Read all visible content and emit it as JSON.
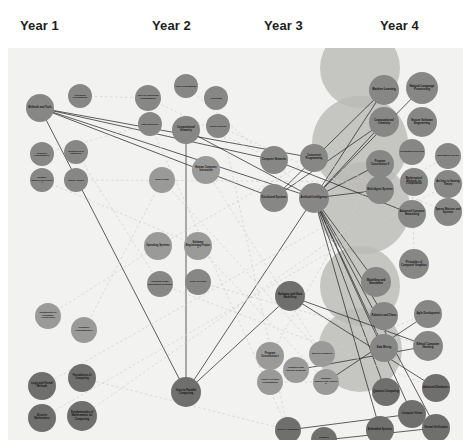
{
  "diagram": {
    "type": "node-link-graph",
    "background_color": "#f2f2f1",
    "node_color": "#8d8d8b",
    "hull_color": "#b9b9b7",
    "edge_color": "#2b2b2b",
    "faint_edge_color": "#cfcfcd",
    "canvas": {
      "width": 455,
      "height": 392
    }
  },
  "columns": [
    {
      "label": "Year 1",
      "x": 20
    },
    {
      "label": "Year 2",
      "x": 152
    },
    {
      "label": "Year 3",
      "x": 264
    },
    {
      "label": "Year 4",
      "x": 380
    }
  ],
  "hulls": [
    {
      "name": "year4-ai-cluster",
      "x": 352,
      "y": 20,
      "r": 40
    },
    {
      "name": "year4-theory-cluster",
      "x": 352,
      "y": 96,
      "r": 48
    },
    {
      "name": "year4-systems-cluster",
      "x": 356,
      "y": 160,
      "r": 46
    },
    {
      "name": "year4-security-cluster",
      "x": 352,
      "y": 238,
      "r": 40
    },
    {
      "name": "year4-capstone-cluster",
      "x": 352,
      "y": 302,
      "r": 42
    }
  ],
  "nodes": [
    {
      "id": "n01",
      "label": "Methods and Tools",
      "year": 1,
      "x": 32,
      "y": 60,
      "r": 14,
      "shade": "mid"
    },
    {
      "id": "n02",
      "label": "Functional Programming",
      "year": 1,
      "x": 72,
      "y": 48,
      "r": 12,
      "shade": "mid"
    },
    {
      "id": "n03",
      "label": "Computer Programming I",
      "year": 1,
      "x": 34,
      "y": 106,
      "r": 12,
      "shade": "mid"
    },
    {
      "id": "n04",
      "label": "Introduction to Databases",
      "year": 1,
      "x": 68,
      "y": 104,
      "r": 12,
      "shade": "mid"
    },
    {
      "id": "n05",
      "label": "Software Engineering Project 1",
      "year": 1,
      "x": 34,
      "y": 132,
      "r": 12,
      "shade": "mid"
    },
    {
      "id": "n06",
      "label": "Matrix Algebra",
      "year": 1,
      "x": 68,
      "y": 132,
      "r": 12,
      "shade": "mid"
    },
    {
      "id": "n07",
      "label": "Introduction to Computer Architecture",
      "year": 1,
      "x": 40,
      "y": 268,
      "r": 13,
      "shade": "light"
    },
    {
      "id": "n08",
      "label": "Computer Programming II",
      "year": 1,
      "x": 76,
      "y": 282,
      "r": 13,
      "shade": "light"
    },
    {
      "id": "n09",
      "label": "Logic and Formal Methods",
      "year": 1,
      "x": 34,
      "y": 338,
      "r": 14,
      "shade": "dark"
    },
    {
      "id": "n10",
      "label": "Foundations of Computing",
      "year": 1,
      "x": 74,
      "y": 330,
      "r": 14,
      "shade": "dark"
    },
    {
      "id": "n11",
      "label": "Discrete Mathematics",
      "year": 1,
      "x": 34,
      "y": 370,
      "r": 14,
      "shade": "dark"
    },
    {
      "id": "n12",
      "label": "Fundamentals of Mathematics for Computing",
      "year": 1,
      "x": 74,
      "y": 368,
      "r": 15,
      "shade": "dark"
    },
    {
      "id": "n13",
      "label": "Intro to Functional Programming",
      "year": 2,
      "x": 140,
      "y": 50,
      "r": 13,
      "shade": "mid"
    },
    {
      "id": "n14",
      "label": "Logic Programming",
      "year": 2,
      "x": 178,
      "y": 38,
      "r": 12,
      "shade": "mid"
    },
    {
      "id": "n15",
      "label": "Algorithms",
      "year": 2,
      "x": 208,
      "y": 50,
      "r": 12,
      "shade": "mid"
    },
    {
      "id": "n16",
      "label": "Data Structures",
      "year": 2,
      "x": 142,
      "y": 76,
      "r": 12,
      "shade": "mid"
    },
    {
      "id": "n17",
      "label": "Computational Geometry",
      "year": 2,
      "x": 178,
      "y": 82,
      "r": 14,
      "shade": "mid"
    },
    {
      "id": "n18",
      "label": "Digital Systems",
      "year": 2,
      "x": 210,
      "y": 78,
      "r": 12,
      "shade": "mid"
    },
    {
      "id": "n19",
      "label": "Web Design",
      "year": 2,
      "x": 154,
      "y": 132,
      "r": 13,
      "shade": "light"
    },
    {
      "id": "n20",
      "label": "Human Computer Interaction",
      "year": 2,
      "x": 198,
      "y": 122,
      "r": 14,
      "shade": "light"
    },
    {
      "id": "n21",
      "label": "Operating Systems",
      "year": 2,
      "x": 150,
      "y": 198,
      "r": 14,
      "shade": "light"
    },
    {
      "id": "n22",
      "label": "Software Engineering Project 1",
      "year": 2,
      "x": 190,
      "y": 198,
      "r": 14,
      "shade": "light"
    },
    {
      "id": "n23",
      "label": "Databases and Information Systems",
      "year": 2,
      "x": 152,
      "y": 236,
      "r": 13,
      "shade": "mid"
    },
    {
      "id": "n24",
      "label": "Cyber Security",
      "year": 2,
      "x": 190,
      "y": 234,
      "r": 13,
      "shade": "mid"
    },
    {
      "id": "n25",
      "label": "Intro to Parallel Computing",
      "year": 2,
      "x": 178,
      "y": 344,
      "r": 15,
      "shade": "dark"
    },
    {
      "id": "n26",
      "label": "Computer Networks",
      "year": 3,
      "x": 266,
      "y": 112,
      "r": 14,
      "shade": "mid"
    },
    {
      "id": "n27",
      "label": "Concurrent Programming",
      "year": 3,
      "x": 306,
      "y": 110,
      "r": 14,
      "shade": "mid"
    },
    {
      "id": "n28",
      "label": "Distributed Systems",
      "year": 3,
      "x": 266,
      "y": 150,
      "r": 14,
      "shade": "mid"
    },
    {
      "id": "n29",
      "label": "Artificial Intelligence",
      "year": 3,
      "x": 306,
      "y": 150,
      "r": 15,
      "shade": "mid"
    },
    {
      "id": "n30",
      "label": "Software and Data Modelling",
      "year": 3,
      "x": 282,
      "y": 248,
      "r": 15,
      "shade": "dark"
    },
    {
      "id": "n31",
      "label": "Program Construction I",
      "year": 3,
      "x": 262,
      "y": 308,
      "r": 14,
      "shade": "light"
    },
    {
      "id": "n32",
      "label": "Web Development",
      "year": 3,
      "x": 314,
      "y": 306,
      "r": 13,
      "shade": "light"
    },
    {
      "id": "n33",
      "label": "Networks and Internet Systems",
      "year": 3,
      "x": 288,
      "y": 322,
      "r": 13,
      "shade": "light"
    },
    {
      "id": "n34",
      "label": "Object Oriented Programming",
      "year": 3,
      "x": 262,
      "y": 334,
      "r": 13,
      "shade": "light"
    },
    {
      "id": "n35",
      "label": "Software Engineering Project 2",
      "year": 3,
      "x": 318,
      "y": 334,
      "r": 13,
      "shade": "light"
    },
    {
      "id": "n36",
      "label": "Intro to Algorithms",
      "year": 3,
      "x": 280,
      "y": 382,
      "r": 13,
      "shade": "dark"
    },
    {
      "id": "n37",
      "label": "Compiler Engineering",
      "year": 3,
      "x": 316,
      "y": 392,
      "r": 13,
      "shade": "dark"
    },
    {
      "id": "n38",
      "label": "Machine Learning",
      "year": 4,
      "x": 376,
      "y": 42,
      "r": 15,
      "shade": "mid"
    },
    {
      "id": "n39",
      "label": "Natural Language Processing",
      "year": 4,
      "x": 414,
      "y": 40,
      "r": 16,
      "shade": "mid"
    },
    {
      "id": "n40",
      "label": "Computational Creativity",
      "year": 4,
      "x": 376,
      "y": 74,
      "r": 15,
      "shade": "mid"
    },
    {
      "id": "n41",
      "label": "Secure Software Engineering",
      "year": 4,
      "x": 414,
      "y": 74,
      "r": 15,
      "shade": "mid"
    },
    {
      "id": "n42",
      "label": "Information Retrieval",
      "year": 4,
      "x": 404,
      "y": 104,
      "r": 13,
      "shade": "mid"
    },
    {
      "id": "n43",
      "label": "Program Construction II",
      "year": 4,
      "x": 372,
      "y": 116,
      "r": 14,
      "shade": "mid"
    },
    {
      "id": "n44",
      "label": "Information Theory",
      "year": 4,
      "x": 440,
      "y": 108,
      "r": 13,
      "shade": "mid"
    },
    {
      "id": "n45",
      "label": "Mathematical Methods for Computation",
      "year": 4,
      "x": 406,
      "y": 134,
      "r": 14,
      "shade": "mid"
    },
    {
      "id": "n46",
      "label": "Multi-Agent Systems",
      "year": 4,
      "x": 372,
      "y": 142,
      "r": 14,
      "shade": "mid"
    },
    {
      "id": "n47",
      "label": "An Intro to Gaming Theory",
      "year": 4,
      "x": 440,
      "y": 136,
      "r": 14,
      "shade": "mid"
    },
    {
      "id": "n48",
      "label": "Advanced Computer Networking",
      "year": 4,
      "x": 404,
      "y": 166,
      "r": 14,
      "shade": "mid"
    },
    {
      "id": "n49",
      "label": "Sparse Matrices and Systems",
      "year": 4,
      "x": 440,
      "y": 164,
      "r": 14,
      "shade": "mid"
    },
    {
      "id": "n50",
      "label": "Principles of Computer Graphics",
      "year": 4,
      "x": 406,
      "y": 216,
      "r": 15,
      "shade": "mid"
    },
    {
      "id": "n51",
      "label": "Modelling and Simulation",
      "year": 4,
      "x": 368,
      "y": 234,
      "r": 15,
      "shade": "mid"
    },
    {
      "id": "n52",
      "label": "Robotics and Chaos",
      "year": 4,
      "x": 376,
      "y": 268,
      "r": 14,
      "shade": "mid"
    },
    {
      "id": "n53",
      "label": "Agile Development",
      "year": 4,
      "x": 420,
      "y": 266,
      "r": 14,
      "shade": "mid"
    },
    {
      "id": "n54",
      "label": "Data Mining",
      "year": 4,
      "x": 376,
      "y": 300,
      "r": 14,
      "shade": "mid"
    },
    {
      "id": "n55",
      "label": "Ethical Computer Hacking",
      "year": 4,
      "x": 420,
      "y": 298,
      "r": 15,
      "shade": "mid"
    },
    {
      "id": "n56",
      "label": "Quantum Computing",
      "year": 4,
      "x": 378,
      "y": 344,
      "r": 14,
      "shade": "dark"
    },
    {
      "id": "n57",
      "label": "Advanced Databases",
      "year": 4,
      "x": 428,
      "y": 340,
      "r": 14,
      "shade": "dark"
    },
    {
      "id": "n58",
      "label": "Computer Vision",
      "year": 4,
      "x": 404,
      "y": 366,
      "r": 14,
      "shade": "dark"
    },
    {
      "id": "n59",
      "label": "Embedded Systems",
      "year": 4,
      "x": 372,
      "y": 382,
      "r": 14,
      "shade": "dark"
    },
    {
      "id": "n60",
      "label": "Formal Verification",
      "year": 4,
      "x": 428,
      "y": 380,
      "r": 14,
      "shade": "dark"
    }
  ],
  "edges": [
    {
      "from": "n01",
      "to": "n26",
      "style": "solid"
    },
    {
      "from": "n01",
      "to": "n28",
      "style": "solid"
    },
    {
      "from": "n01",
      "to": "n29",
      "style": "solid"
    },
    {
      "from": "n01",
      "to": "n27",
      "style": "solid"
    },
    {
      "from": "n01",
      "to": "n25",
      "style": "solid"
    },
    {
      "from": "n17",
      "to": "n29",
      "style": "solid"
    },
    {
      "from": "n17",
      "to": "n25",
      "style": "solid"
    },
    {
      "from": "n29",
      "to": "n38",
      "style": "solid"
    },
    {
      "from": "n29",
      "to": "n39",
      "style": "solid"
    },
    {
      "from": "n29",
      "to": "n40",
      "style": "solid"
    },
    {
      "from": "n29",
      "to": "n46",
      "style": "solid"
    },
    {
      "from": "n29",
      "to": "n43",
      "style": "solid"
    },
    {
      "from": "n29",
      "to": "n51",
      "style": "solid"
    },
    {
      "from": "n29",
      "to": "n52",
      "style": "solid"
    },
    {
      "from": "n29",
      "to": "n54",
      "style": "solid"
    },
    {
      "from": "n29",
      "to": "n56",
      "style": "solid"
    },
    {
      "from": "n29",
      "to": "n58",
      "style": "solid"
    },
    {
      "from": "n29",
      "to": "n59",
      "style": "solid"
    },
    {
      "from": "n29",
      "to": "n60",
      "style": "solid"
    },
    {
      "from": "n28",
      "to": "n38",
      "style": "solid"
    },
    {
      "from": "n28",
      "to": "n40",
      "style": "solid"
    },
    {
      "from": "n26",
      "to": "n48",
      "style": "solid"
    },
    {
      "from": "n25",
      "to": "n29",
      "style": "solid"
    },
    {
      "from": "n25",
      "to": "n30",
      "style": "solid"
    },
    {
      "from": "n30",
      "to": "n55",
      "style": "solid"
    },
    {
      "from": "n30",
      "to": "n57",
      "style": "solid"
    },
    {
      "from": "n33",
      "to": "n55",
      "style": "solid"
    },
    {
      "from": "n35",
      "to": "n53",
      "style": "solid"
    },
    {
      "from": "n36",
      "to": "n58",
      "style": "solid"
    },
    {
      "from": "n37",
      "to": "n60",
      "style": "solid"
    },
    {
      "from": "n03",
      "to": "n16",
      "style": "dashed"
    },
    {
      "from": "n04",
      "to": "n23",
      "style": "dashed"
    },
    {
      "from": "n05",
      "to": "n22",
      "style": "dashed"
    },
    {
      "from": "n06",
      "to": "n45",
      "style": "dashed"
    },
    {
      "from": "n07",
      "to": "n21",
      "style": "dashed"
    },
    {
      "from": "n08",
      "to": "n19",
      "style": "dashed"
    },
    {
      "from": "n09",
      "to": "n44",
      "style": "dashed"
    },
    {
      "from": "n10",
      "to": "n36",
      "style": "dashed"
    },
    {
      "from": "n11",
      "to": "n47",
      "style": "dashed"
    },
    {
      "from": "n12",
      "to": "n45",
      "style": "dashed"
    },
    {
      "from": "n13",
      "to": "n26",
      "style": "dashed"
    },
    {
      "from": "n14",
      "to": "n29",
      "style": "dashed"
    },
    {
      "from": "n15",
      "to": "n36",
      "style": "dashed"
    },
    {
      "from": "n18",
      "to": "n48",
      "style": "dashed"
    },
    {
      "from": "n19",
      "to": "n32",
      "style": "dashed"
    },
    {
      "from": "n20",
      "to": "n32",
      "style": "dashed"
    },
    {
      "from": "n21",
      "to": "n27",
      "style": "dashed"
    },
    {
      "from": "n22",
      "to": "n35",
      "style": "dashed"
    },
    {
      "from": "n23",
      "to": "n57",
      "style": "dashed"
    },
    {
      "from": "n24",
      "to": "n55",
      "style": "dashed"
    },
    {
      "from": "n31",
      "to": "n43",
      "style": "dashed"
    },
    {
      "from": "n34",
      "to": "n35",
      "style": "dashed"
    },
    {
      "from": "n02",
      "to": "n13",
      "style": "dashed"
    },
    {
      "from": "n16",
      "to": "n36",
      "style": "dashed"
    },
    {
      "from": "n27",
      "to": "n49",
      "style": "dashed"
    },
    {
      "from": "n32",
      "to": "n53",
      "style": "dashed"
    },
    {
      "from": "n42",
      "to": "n50",
      "style": "dashed"
    }
  ]
}
